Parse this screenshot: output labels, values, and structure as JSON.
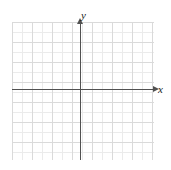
{
  "figure": {
    "width": 171,
    "height": 170,
    "background_color": "#ffffff"
  },
  "chart_data": {
    "type": "scatter",
    "title": "",
    "subtitle": "",
    "xlabel": "x",
    "ylabel": "y",
    "series": [],
    "x": [],
    "values": [],
    "annotations": [],
    "legend": {
      "entries": [],
      "position": "none"
    },
    "grid": {
      "visible": true,
      "minor_step": 1,
      "major_step": 2,
      "minor_color": "#ebebeb",
      "major_color": "#dadada"
    },
    "axes": {
      "color": "#515151",
      "x_arrow": "right",
      "y_arrow": "up",
      "tick_labels_visible": false,
      "origin_label": "",
      "xlim": [
        -7,
        7.5
      ],
      "ylim": [
        -7,
        6.5
      ],
      "xticks": [],
      "yticks": []
    }
  },
  "labels": {
    "x_axis": "x",
    "y_axis": "y"
  },
  "geometry": {
    "grid": {
      "left": 12,
      "top": 22,
      "width": 142,
      "height": 138,
      "cell": 10,
      "major_cell": 20
    },
    "x_axis": {
      "left": 12,
      "top": 89,
      "length": 141
    },
    "y_axis": {
      "left": 80,
      "top": 24,
      "length": 136
    },
    "x_label_pos": {
      "left": 158,
      "top": 84
    },
    "y_label_pos": {
      "left": 81,
      "top": 10
    }
  }
}
